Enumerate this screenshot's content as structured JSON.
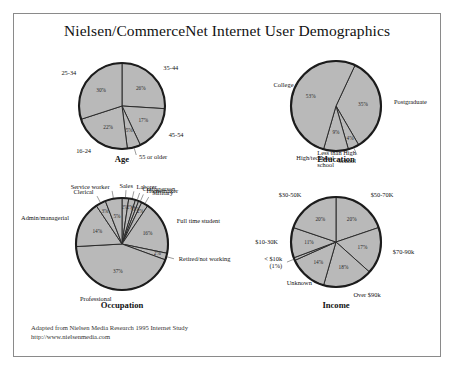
{
  "poster": {
    "title": "Nielsen/CommerceNet Internet User Demographics",
    "source_line_1": "Adapted from Nielsen Media Research 1995 Internet Study",
    "source_line_2": "http://www.nielsenmedia.com",
    "border_color": "#8a8a8a",
    "background_color": "#ffffff",
    "slice_fill": "#b9b9b9",
    "slice_stroke": "#2b2b2b"
  },
  "chart_data": [
    {
      "type": "pie",
      "id": "age",
      "title": "Age",
      "start_angle": -90,
      "labels": [
        "35-44",
        "45-54",
        "55 or older",
        "16-24",
        "25-34"
      ],
      "values": [
        26,
        17,
        5,
        22,
        30
      ],
      "value_labels": [
        "26%",
        "17%",
        "5%",
        "22%",
        "30%"
      ],
      "label_positions": [
        "start",
        "start",
        "start",
        "end",
        "end"
      ]
    },
    {
      "type": "pie",
      "id": "education",
      "title": "Education",
      "start_angle": -65,
      "labels": [
        "Postgraduate",
        "Less than High School",
        "High/technical school",
        "College"
      ],
      "values": [
        35,
        4,
        9,
        53
      ],
      "value_labels": [
        "35%",
        "4%",
        "9%",
        "53%"
      ],
      "label_positions": [
        "start",
        "end",
        "end",
        "mid"
      ]
    },
    {
      "type": "pie",
      "id": "occupation",
      "title": "Occupation",
      "start_angle": -90,
      "labels": [
        "Sales",
        "Laborer",
        "Craftsperson",
        "Homemaker",
        "Military",
        "Full time student",
        "Retired/not working",
        "Professional",
        "Admin/managerial",
        "Clerical",
        "Service worker"
      ],
      "values": [
        2,
        2,
        1,
        1,
        2,
        16,
        2,
        37,
        14,
        3,
        5
      ],
      "value_labels": [
        "2%",
        "2%",
        "1%",
        "1%",
        "2%",
        "16%",
        "2%",
        "37%",
        "14%",
        "3%",
        "5%"
      ],
      "label_positions": [
        "mid",
        "start",
        "start",
        "start",
        "start",
        "start",
        "start",
        "end",
        "end",
        "end",
        "end"
      ]
    },
    {
      "type": "pie",
      "id": "income",
      "title": "Income",
      "start_angle": -90,
      "labels": [
        "$50-70K",
        "$70-90k",
        "Over $90k",
        "Unknown",
        "< $10k (1%)",
        "$10-30K",
        "$30-50K"
      ],
      "values": [
        20,
        17,
        18,
        14,
        1,
        11,
        20
      ],
      "value_labels": [
        "20%",
        "17%",
        "18%",
        "14%",
        "",
        "11%",
        "20%"
      ],
      "label_positions": [
        "start",
        "start",
        "start",
        "mid",
        "end",
        "end",
        "end"
      ]
    }
  ]
}
